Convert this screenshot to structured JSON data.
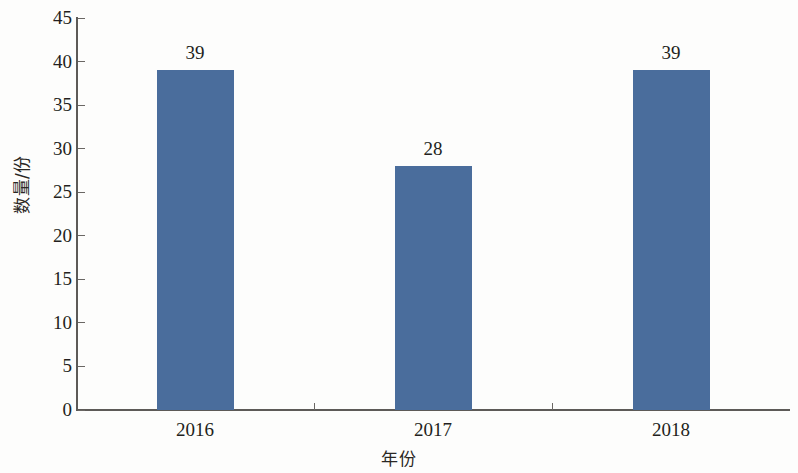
{
  "chart_data": {
    "type": "bar",
    "title": "",
    "subtitle": "",
    "xlabel": "年份",
    "ylabel": "数量/份",
    "categories": [
      "2016",
      "2017",
      "2018"
    ],
    "values": [
      39,
      28,
      39
    ],
    "data_labels": [
      "39",
      "28",
      "39"
    ],
    "series": [
      {
        "name": "数量/份",
        "values": [
          39,
          28,
          39
        ],
        "color": "#4a6d9c"
      }
    ],
    "ylim": [
      0,
      45
    ],
    "ytick_step": 5,
    "ytick_labels": [
      "0",
      "5",
      "10",
      "15",
      "20",
      "25",
      "30",
      "35",
      "40",
      "45"
    ],
    "ytick_values": [
      0,
      5,
      10,
      15,
      20,
      25,
      30,
      35,
      40,
      45
    ],
    "grid": false,
    "legend": "none",
    "legend_position": "none",
    "axis_color": "#5d5a57",
    "background_color": "#fdfdfc",
    "bar_color": "#4a6d9c",
    "text_color": "#231f20",
    "annotations": []
  }
}
